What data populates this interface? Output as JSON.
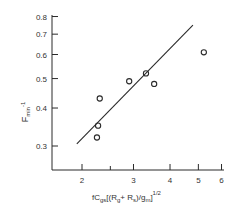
{
  "chart_data": {
    "type": "scatter",
    "title": "",
    "xlabel": "fC_gs[(R_g+R_s)/g_m]^1/2",
    "ylabel": "F_min^-1",
    "x_scale": "log",
    "y_scale": "log",
    "xlim": [
      1.85,
      6
    ],
    "ylim": [
      0.27,
      0.8
    ],
    "x_ticks": [
      2,
      3,
      4,
      5,
      6
    ],
    "x_tick_labels": [
      "2",
      "3",
      "4",
      "5",
      "6"
    ],
    "y_ticks": [
      0.3,
      0.4,
      0.5,
      0.6,
      0.7,
      0.8
    ],
    "y_tick_labels": [
      "0.3",
      "0.4",
      "0.5",
      "0.6",
      "0.7",
      "0.8"
    ],
    "grid": false,
    "legend": null,
    "series": [
      {
        "name": "measured",
        "marker": "open-circle",
        "x": [
          2.25,
          2.27,
          2.3,
          2.9,
          3.31,
          3.53,
          5.22
        ],
        "y": [
          0.32,
          0.35,
          0.43,
          0.49,
          0.52,
          0.48,
          0.61
        ]
      },
      {
        "name": "fit-line",
        "style": "line",
        "x": [
          1.92,
          4.79
        ],
        "y": [
          0.305,
          0.75
        ]
      }
    ]
  },
  "labels": {
    "y_axis": {
      "main": "F",
      "sub": "min",
      "sup": "-1"
    },
    "x_axis": {
      "f": "fC",
      "gs": "gs",
      "open": "[(R",
      "g": "g",
      "plus": "+ R",
      "s": "s",
      "div": ")/g",
      "m": "m",
      "close": "]",
      "exp": "1/2"
    },
    "x_ticks": [
      "2",
      "3",
      "4",
      "5",
      "6"
    ],
    "y_ticks": [
      "0.3",
      "0.4",
      "0.5",
      "0.6",
      "0.7",
      "0.8"
    ]
  },
  "colors": {
    "ink": "#2a2a2a",
    "background": "#ffffff"
  }
}
